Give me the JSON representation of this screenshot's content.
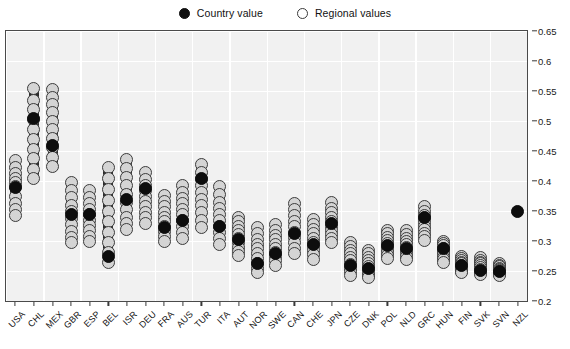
{
  "legend": {
    "country": {
      "label": "Country value",
      "marker": "filled-circle-icon",
      "color": "#0d0d0d"
    },
    "regional": {
      "label": "Regional  values",
      "marker": "open-circle-icon",
      "color": "#d4d4d4"
    }
  },
  "chart_data": {
    "type": "scatter",
    "title": "",
    "xlabel": "",
    "ylabel": "",
    "ylim": [
      0.2,
      0.65
    ],
    "yticks": [
      0.2,
      0.25,
      0.3,
      0.35,
      0.4,
      0.45,
      0.5,
      0.55,
      0.6,
      0.65
    ],
    "ytick_labels": [
      "0.2",
      "0.25",
      "0.3",
      "0.35",
      "0.4",
      "0.45",
      "0.5",
      "0.55",
      "0.6",
      "0.65"
    ],
    "grid": true,
    "legend_position": "top-center",
    "categories": [
      "USA",
      "CHL",
      "MEX",
      "GBR",
      "ESP",
      "BEL",
      "ISR",
      "DEU",
      "FRA",
      "AUS",
      "TUR",
      "ITA",
      "AUT",
      "NOR",
      "SWE",
      "CAN",
      "CHE",
      "JPN",
      "CZE",
      "DNK",
      "POL",
      "NLD",
      "GRC",
      "HUN",
      "FIN",
      "SVK",
      "SVN",
      "NZL"
    ],
    "series": [
      {
        "name": "Country value",
        "values": [
          0.39,
          0.505,
          0.459,
          0.345,
          0.345,
          0.275,
          0.37,
          0.387,
          0.322,
          0.334,
          0.405,
          0.325,
          0.303,
          0.262,
          0.279,
          0.312,
          0.295,
          0.33,
          0.259,
          0.255,
          0.292,
          0.288,
          0.34,
          0.288,
          0.259,
          0.251,
          0.25,
          0.349
        ]
      },
      {
        "name": "Regional values",
        "points": [
          [
            0.435,
            0.423,
            0.412,
            0.405,
            0.398,
            0.391,
            0.375,
            0.362,
            0.352,
            0.343
          ],
          [
            0.555,
            0.535,
            0.519,
            0.503,
            0.486,
            0.47,
            0.453,
            0.437,
            0.42,
            0.404
          ],
          [
            0.552,
            0.54,
            0.528,
            0.514,
            0.5,
            0.486,
            0.471,
            0.456,
            0.44,
            0.424
          ],
          [
            0.398,
            0.385,
            0.372,
            0.36,
            0.349,
            0.338,
            0.327,
            0.316,
            0.306,
            0.297
          ],
          [
            0.384,
            0.372,
            0.362,
            0.353,
            0.344,
            0.335,
            0.326,
            0.317,
            0.308,
            0.299
          ],
          [
            0.423,
            0.404,
            0.386,
            0.368,
            0.35,
            0.332,
            0.315,
            0.298,
            0.281,
            0.264
          ],
          [
            0.436,
            0.421,
            0.406,
            0.392,
            0.378,
            0.365,
            0.352,
            0.34,
            0.329,
            0.319
          ],
          [
            0.414,
            0.403,
            0.393,
            0.384,
            0.375,
            0.366,
            0.357,
            0.348,
            0.339,
            0.33
          ],
          [
            0.376,
            0.366,
            0.357,
            0.348,
            0.34,
            0.332,
            0.324,
            0.316,
            0.308,
            0.3
          ],
          [
            0.392,
            0.381,
            0.371,
            0.362,
            0.353,
            0.344,
            0.334,
            0.325,
            0.315,
            0.305
          ],
          [
            0.428,
            0.415,
            0.403,
            0.392,
            0.381,
            0.37,
            0.359,
            0.347,
            0.335,
            0.322
          ],
          [
            0.391,
            0.377,
            0.365,
            0.354,
            0.344,
            0.334,
            0.324,
            0.314,
            0.304,
            0.294
          ],
          [
            0.34,
            0.332,
            0.325,
            0.318,
            0.311,
            0.304,
            0.297,
            0.29,
            0.283,
            0.276
          ],
          [
            0.322,
            0.312,
            0.303,
            0.295,
            0.287,
            0.279,
            0.271,
            0.263,
            0.255,
            0.247
          ],
          [
            0.327,
            0.318,
            0.31,
            0.302,
            0.295,
            0.288,
            0.281,
            0.274,
            0.267,
            0.26
          ],
          [
            0.363,
            0.352,
            0.342,
            0.333,
            0.324,
            0.315,
            0.306,
            0.297,
            0.288,
            0.279
          ],
          [
            0.336,
            0.327,
            0.319,
            0.312,
            0.305,
            0.298,
            0.291,
            0.284,
            0.277,
            0.27
          ],
          [
            0.364,
            0.355,
            0.347,
            0.339,
            0.332,
            0.325,
            0.318,
            0.311,
            0.304,
            0.297
          ],
          [
            0.298,
            0.291,
            0.285,
            0.279,
            0.273,
            0.267,
            0.261,
            0.255,
            0.249,
            0.243
          ],
          [
            0.285,
            0.279,
            0.273,
            0.268,
            0.263,
            0.258,
            0.253,
            0.248,
            0.243,
            0.239
          ],
          [
            0.318,
            0.312,
            0.306,
            0.301,
            0.296,
            0.291,
            0.286,
            0.281,
            0.276,
            0.271
          ],
          [
            0.318,
            0.311,
            0.305,
            0.3,
            0.295,
            0.29,
            0.285,
            0.28,
            0.275,
            0.27
          ],
          [
            0.358,
            0.35,
            0.343,
            0.337,
            0.331,
            0.325,
            0.319,
            0.313,
            0.307,
            0.301
          ],
          [
            0.3,
            0.296,
            0.292,
            0.288,
            0.284,
            0.281,
            0.277,
            0.273,
            0.269,
            0.265
          ],
          [
            0.275,
            0.271,
            0.268,
            0.265,
            0.262,
            0.259,
            0.256,
            0.253,
            0.25,
            0.247
          ],
          [
            0.272,
            0.268,
            0.265,
            0.262,
            0.259,
            0.256,
            0.253,
            0.25,
            0.247,
            0.244
          ],
          [
            0.262,
            0.259,
            0.257,
            0.255,
            0.253,
            0.251,
            0.249,
            0.247,
            0.245,
            0.243
          ],
          []
        ]
      }
    ]
  }
}
